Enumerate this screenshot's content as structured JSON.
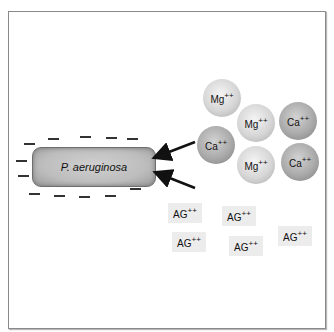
{
  "diagram": {
    "bacterium": {
      "label": "P. aeruginosa"
    },
    "cations": [
      {
        "symbol": "Mg",
        "charge": "++",
        "type": "mg"
      },
      {
        "symbol": "Mg",
        "charge": "++",
        "type": "mg"
      },
      {
        "symbol": "Ca",
        "charge": "++",
        "type": "ca"
      },
      {
        "symbol": "Ca",
        "charge": "++",
        "type": "ca"
      },
      {
        "symbol": "Mg",
        "charge": "++",
        "type": "mg"
      },
      {
        "symbol": "Ca",
        "charge": "++",
        "type": "ca"
      }
    ],
    "aminoglycosides": [
      {
        "symbol": "AG",
        "charge": "++"
      },
      {
        "symbol": "AG",
        "charge": "++"
      },
      {
        "symbol": "AG",
        "charge": "++"
      },
      {
        "symbol": "AG",
        "charge": "++"
      },
      {
        "symbol": "AG",
        "charge": "++"
      }
    ],
    "surface_charge_symbol": "negative",
    "colors": {
      "mg_ion": "#d6d6d6",
      "ca_ion": "#aaaaaa",
      "bacterium": "#bdbdbd",
      "ag_box": "#ececec",
      "arrow": "#111111"
    }
  }
}
